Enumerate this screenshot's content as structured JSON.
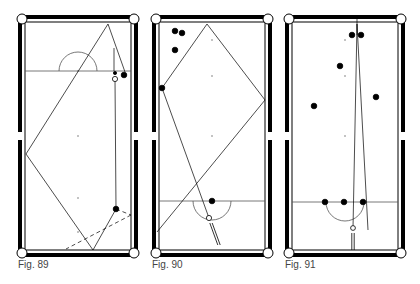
{
  "figures": [
    {
      "id": "fig89",
      "caption": "Fig. 89",
      "table": {
        "x": 18,
        "y": 15,
        "w": 120,
        "h": 242
      },
      "baulk_line_y": 71,
      "d_center": [
        78,
        71
      ],
      "d_radius": 19,
      "d_side": "top",
      "spots": [
        [
          78,
          71
        ],
        [
          78,
          136
        ],
        [
          78,
          198
        ],
        [
          78,
          232
        ]
      ],
      "balls": [
        {
          "x": 124,
          "y": 75,
          "r": 2.8,
          "fill": "#000",
          "name": "object-ball"
        },
        {
          "x": 115,
          "y": 73,
          "r": 1.6,
          "fill": "#000",
          "name": "small-ball"
        },
        {
          "x": 115,
          "y": 79,
          "r": 2.6,
          "fill": "#fff",
          "name": "cue-ball"
        },
        {
          "x": 116,
          "y": 209,
          "r": 2.8,
          "fill": "#000",
          "name": "object-ball"
        }
      ],
      "paths": [
        {
          "points": [
            [
              115,
              79
            ],
            [
              116,
              209
            ],
            [
              93,
              250
            ],
            [
              26,
              154
            ],
            [
              108,
              24
            ],
            [
              125,
              72
            ]
          ],
          "dashed": false
        },
        {
          "points": [
            [
              114,
              48
            ],
            [
              114,
              71
            ]
          ],
          "dashed": false
        },
        {
          "points": [
            [
              116,
              209
            ],
            [
              131,
              215
            ]
          ],
          "dashed": true
        },
        {
          "points": [
            [
              131,
              215
            ],
            [
              66,
              249
            ]
          ],
          "dashed": true
        }
      ]
    },
    {
      "id": "fig90",
      "caption": "Fig. 90",
      "table": {
        "x": 152,
        "y": 15,
        "w": 120,
        "h": 242
      },
      "baulk_line_y": 201,
      "d_center": [
        212,
        201
      ],
      "d_radius": 19,
      "d_side": "bottom",
      "spots": [
        [
          212,
          40
        ],
        [
          212,
          76
        ],
        [
          212,
          136
        ],
        [
          212,
          201
        ]
      ],
      "balls": [
        {
          "x": 175,
          "y": 31,
          "r": 2.8,
          "fill": "#000",
          "name": "object-ball"
        },
        {
          "x": 182,
          "y": 33,
          "r": 2.8,
          "fill": "#000",
          "name": "object-ball"
        },
        {
          "x": 175,
          "y": 50,
          "r": 2.8,
          "fill": "#000",
          "name": "object-ball"
        },
        {
          "x": 162,
          "y": 88,
          "r": 2.8,
          "fill": "#000",
          "name": "object-ball"
        },
        {
          "x": 212,
          "y": 201,
          "r": 2.8,
          "fill": "#000",
          "name": "object-ball"
        },
        {
          "x": 209,
          "y": 218,
          "r": 2.6,
          "fill": "#fff",
          "name": "cue-ball"
        }
      ],
      "paths": [
        {
          "points": [
            [
              209,
              218
            ],
            [
              162,
              88
            ],
            [
              207,
              24
            ],
            [
              265,
              100
            ],
            [
              157,
              232
            ]
          ],
          "dashed": false
        }
      ],
      "cue": {
        "x1": 211,
        "y1": 223,
        "x2": 219,
        "y2": 245
      }
    },
    {
      "id": "fig91",
      "caption": "Fig. 91",
      "table": {
        "x": 285,
        "y": 15,
        "w": 120,
        "h": 242
      },
      "baulk_line_y": 202,
      "d_center": [
        345,
        202
      ],
      "d_radius": 19,
      "d_side": "bottom",
      "spots": [
        [
          345,
          40
        ],
        [
          345,
          76
        ],
        [
          345,
          136
        ],
        [
          345,
          202
        ]
      ],
      "balls": [
        {
          "x": 352,
          "y": 35,
          "r": 2.8,
          "fill": "#000",
          "name": "object-ball"
        },
        {
          "x": 361,
          "y": 35,
          "r": 2.8,
          "fill": "#000",
          "name": "object-ball"
        },
        {
          "x": 340,
          "y": 66,
          "r": 2.8,
          "fill": "#000",
          "name": "object-ball"
        },
        {
          "x": 376,
          "y": 97,
          "r": 2.8,
          "fill": "#000",
          "name": "object-ball"
        },
        {
          "x": 314,
          "y": 106,
          "r": 2.8,
          "fill": "#000",
          "name": "object-ball"
        },
        {
          "x": 325,
          "y": 202,
          "r": 2.8,
          "fill": "#000",
          "name": "object-ball"
        },
        {
          "x": 344,
          "y": 202,
          "r": 2.8,
          "fill": "#000",
          "name": "object-ball"
        },
        {
          "x": 363,
          "y": 202,
          "r": 2.8,
          "fill": "#000",
          "name": "object-ball"
        },
        {
          "x": 353,
          "y": 228,
          "r": 2.4,
          "fill": "#fff",
          "name": "cue-ball"
        }
      ],
      "paths": [
        {
          "points": [
            [
              353,
              228
            ],
            [
              357,
              24
            ]
          ],
          "dashed": false
        },
        {
          "points": [
            [
              357,
              24
            ],
            [
              368,
              230
            ]
          ],
          "dashed": false
        },
        {
          "points": [
            [
              357,
              18
            ],
            [
              357,
              35
            ]
          ],
          "dashed": false
        }
      ],
      "cue": {
        "x1": 353,
        "y1": 233,
        "x2": 353,
        "y2": 250
      }
    }
  ],
  "colors": {
    "ink": "#000000",
    "line": "#555555",
    "spot": "#777777",
    "caption": "#444444"
  }
}
